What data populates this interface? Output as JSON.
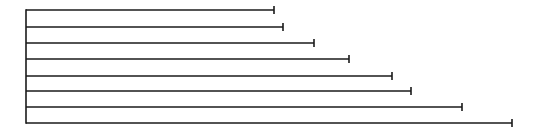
{
  "diagram": {
    "type": "horizontal-bar-lines",
    "stroke_color": "#1a1a1a",
    "axis": {
      "x": 26,
      "y_top": 10,
      "y_bottom": 123
    },
    "bars": [
      {
        "y": 10,
        "x_end": 274
      },
      {
        "y": 27,
        "x_end": 283
      },
      {
        "y": 43,
        "x_end": 314
      },
      {
        "y": 59,
        "x_end": 349
      },
      {
        "y": 76,
        "x_end": 392
      },
      {
        "y": 91,
        "x_end": 411
      },
      {
        "y": 107,
        "x_end": 462
      },
      {
        "y": 123,
        "x_end": 512
      }
    ]
  }
}
